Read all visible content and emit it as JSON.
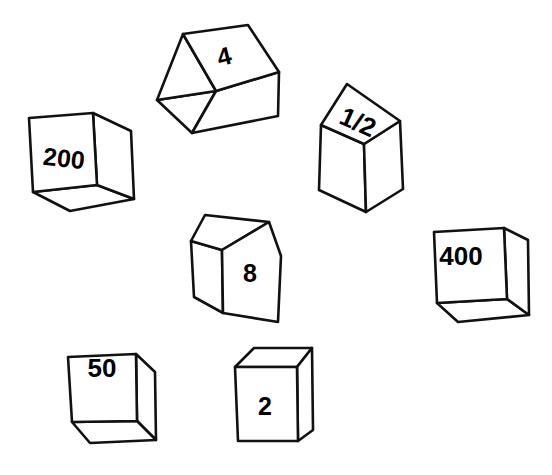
{
  "scene": {
    "title": "Numbered Cubes",
    "background_color": "#ffffff",
    "stroke_color": "#111111",
    "face_fill": "#ffffff",
    "label_color": "#000000",
    "width": 552,
    "height": 475,
    "style": "hand-drawn line art, black outline on white",
    "cube_count": 7
  },
  "cubes": [
    {
      "id": "cube-200",
      "label": "200",
      "label_face": "front",
      "label_x": 64,
      "label_y": 158,
      "label_size": 25,
      "label_rotation": 7,
      "visible_faces": [
        "front",
        "right",
        "bottom"
      ],
      "front_points": "29,118 93,113 97,185 33,192",
      "right_points": "93,113 131,131 134,199 97,185",
      "bottom_points": "33,192 97,185 134,199 70,210"
    },
    {
      "id": "cube-4",
      "label": "4",
      "label_face": "top-right",
      "label_x": 224,
      "label_y": 54,
      "label_size": 24,
      "label_rotation": -14,
      "visible_faces": [
        "top-left",
        "top-right",
        "front"
      ],
      "front_points": "192,133 216,91 279,72 278,115",
      "right_points": "216,91 279,72 248,25",
      "top_left_points": "157,100 183,34 216,91 192,133",
      "top_right_points": "183,34 248,25 279,72 216,91"
    },
    {
      "id": "cube-half",
      "label": "1/2",
      "label_face": "top",
      "label_x": 357,
      "label_y": 123,
      "label_size": 25,
      "label_rotation": 22,
      "visible_faces": [
        "top",
        "left",
        "right"
      ],
      "top_points": "321,125 347,84 400,121 364,144",
      "left_points": "321,125 364,144 366,212 319,191",
      "right_points": "364,144 400,121 403,190 366,212"
    },
    {
      "id": "cube-8",
      "label": "8",
      "label_face": "front",
      "label_x": 249,
      "label_y": 272,
      "label_size": 24,
      "label_rotation": 0,
      "visible_faces": [
        "left",
        "front",
        "top"
      ],
      "left_points": "191,241 222,249 223,313 193,297",
      "front_points": "222,249 281,255 278,322 223,313",
      "top_points": "191,241 204,215 268,222 281,255 222,249"
    },
    {
      "id": "cube-400",
      "label": "400",
      "label_face": "front",
      "label_x": 459,
      "label_y": 256,
      "label_size": 25,
      "label_rotation": 0,
      "visible_faces": [
        "front",
        "right",
        "bottom"
      ],
      "front_points": "434,232 504,228 507,300 437,303",
      "right_points": "504,228 527,240 529,316 507,300",
      "bottom_points": "437,303 507,300 529,316 458,322"
    },
    {
      "id": "cube-50",
      "label": "50",
      "label_face": "front",
      "label_x": 105,
      "label_y": 368,
      "label_size": 25,
      "label_rotation": 0,
      "visible_faces": [
        "front",
        "right",
        "bottom"
      ],
      "front_points": "68,357 136,354 137,421 72,422"
    },
    {
      "id": "cube-2",
      "label": "2",
      "label_face": "front",
      "label_x": 263,
      "label_y": 405,
      "label_size": 24,
      "label_rotation": 0,
      "visible_faces": [
        "top",
        "front",
        "right"
      ],
      "top_points": "234,367 253,348 311,348 296,367"
    }
  ]
}
